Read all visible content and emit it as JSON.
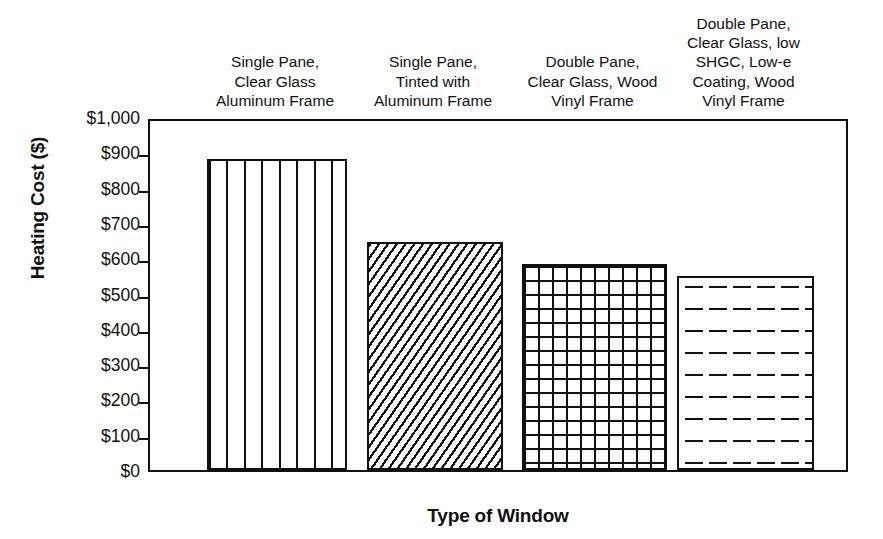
{
  "chart_data": {
    "type": "bar",
    "title": "",
    "xlabel": "Type of Window",
    "ylabel": "Heating Cost ($)",
    "categories": [
      "Single Pane, Clear Glass Aluminum Frame",
      "Single Pane, Tinted with Aluminum Frame",
      "Double Pane, Clear Glass, Wood Vinyl Frame",
      "Double Pane, Clear Glass, low SHGC, Low-e Coating, Wood Vinyl Frame"
    ],
    "values": [
      880,
      645,
      585,
      550
    ],
    "ylim": [
      0,
      1000
    ],
    "ytick_values": [
      0,
      100,
      200,
      300,
      400,
      500,
      600,
      700,
      800,
      900,
      1000
    ],
    "ytick_labels": [
      "$0",
      "$100",
      "$200",
      "$300",
      "$400",
      "$500",
      "$600",
      "$700",
      "$800",
      "$900",
      "$1,000"
    ],
    "grid": false,
    "legend": null,
    "bar_fill_patterns": [
      "vertical-lines",
      "diagonal-hatch",
      "brick",
      "horizontal-dashes"
    ],
    "line_color": "#111111",
    "background_color": "#ffffff"
  },
  "axis": {
    "y_title": "Heating Cost ($)",
    "x_title": "Type of Window"
  },
  "category_label_lines": [
    [
      "Single Pane,",
      "Clear Glass",
      "Aluminum Frame"
    ],
    [
      "Single Pane,",
      "Tinted with",
      "Aluminum Frame"
    ],
    [
      "Double Pane,",
      "Clear Glass, Wood",
      "Vinyl Frame"
    ],
    [
      "Double Pane,",
      "Clear Glass, low",
      "SHGC, Low-e",
      "Coating, Wood",
      "Vinyl Frame"
    ]
  ]
}
